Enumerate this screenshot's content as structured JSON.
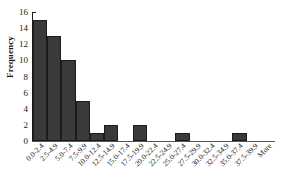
{
  "chart_data": {
    "type": "bar",
    "title": "",
    "xlabel": "",
    "ylabel": "Frequency",
    "ylim": [
      0,
      16
    ],
    "yticks": [
      0,
      2,
      4,
      6,
      8,
      10,
      12,
      14,
      16
    ],
    "grid": false,
    "legend": false,
    "bar_color": "#3a3a3a",
    "bar_edge_color": "#1c1c1c",
    "axis_color": "#1a1a1a",
    "categories": [
      "0.0-2.4",
      "2.5-4.9",
      "5.0-7.4",
      "7.5-9.9",
      "10.0-12.4",
      "12.5-14.9",
      "15.0-17.4",
      "17.5-19.9",
      "20.0-22.4",
      "22.5-24.9",
      "25.0-27.4",
      "27.5-29.9",
      "30.0-32.4",
      "32.5-34.9",
      "35.0-37.4",
      "37.5-39.9",
      "More"
    ],
    "values": [
      15,
      13,
      10,
      5,
      1,
      2,
      0,
      2,
      0,
      0,
      1,
      0,
      0,
      0,
      1,
      0,
      0
    ]
  }
}
